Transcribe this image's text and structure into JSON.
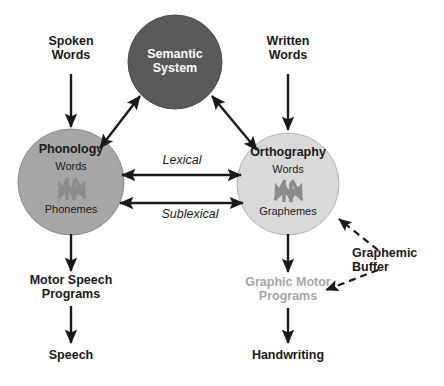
{
  "diagram": {
    "colors": {
      "semantic_fill": "#595959",
      "phonology_fill": "#a6a6a6",
      "orthography_fill": "#d9d9d9",
      "circle_stroke": "#7f7f7f",
      "arrow": "#1a1a1a",
      "inner_arrow": "#808080",
      "muted_text": "#a6a6a6",
      "text": "#1a1a1a",
      "light_text": "#ffffff",
      "background": "#ffffff"
    },
    "circles": [
      {
        "id": "semantic-system",
        "title": "Semantic\nSystem",
        "sub_top": "",
        "sub_bottom": "",
        "cx": 175,
        "cy": 62,
        "r": 47,
        "fill": "#595959",
        "text_color": "#ffffff"
      },
      {
        "id": "phonology",
        "title": "Phonology",
        "sub_top": "Words",
        "sub_bottom": "Phonemes",
        "cx": 71,
        "cy": 182,
        "r": 53,
        "fill": "#a6a6a6",
        "text_color": "#1a1a1a"
      },
      {
        "id": "orthography",
        "title": "Orthography",
        "sub_top": "Words",
        "sub_bottom": "Graphemes",
        "cx": 288,
        "cy": 184,
        "r": 51,
        "fill": "#d9d9d9",
        "text_color": "#1a1a1a"
      }
    ],
    "inputs": [
      {
        "id": "spoken-words",
        "text": "Spoken\nWords",
        "x": 71,
        "y": 38,
        "muted": false
      },
      {
        "id": "written-words",
        "text": "Written\nWords",
        "x": 288,
        "y": 38,
        "muted": false
      }
    ],
    "outputs": [
      {
        "id": "motor-speech-programs",
        "text": "Motor Speech\nProgrammes",
        "x": 71,
        "y": 282,
        "muted": false
      },
      {
        "id": "graphic-motor-programs",
        "text": "Graphic Motor\nProgrammes",
        "x": 288,
        "y": 284,
        "muted": true
      },
      {
        "id": "speech",
        "text": "Speech",
        "x": 71,
        "y": 355,
        "muted": false
      },
      {
        "id": "handwriting",
        "text": "Handwriting",
        "x": 288,
        "y": 355,
        "muted": false
      }
    ],
    "route_labels": [
      {
        "id": "lexical",
        "text": "Lexical",
        "x": 182,
        "y": 162
      },
      {
        "id": "sublexical",
        "text": "Sublexical",
        "x": 188,
        "y": 215
      }
    ],
    "annotations": [
      {
        "id": "graphemic-buffer",
        "text": "Graphemic\nBuffer",
        "x": 400,
        "y": 258
      }
    ],
    "output_label_texts": {
      "motor_speech": "Motor Speech\nPrograms",
      "graphic_motor": "Graphic Motor\nPrograms",
      "speech": "Speech",
      "handwriting": "Handwriting"
    },
    "connections": [
      {
        "id": "spoken-to-phonology",
        "from": "Spoken Words",
        "to": "Phonology",
        "style": "solid",
        "arrows": "single"
      },
      {
        "id": "written-to-orthography",
        "from": "Written Words",
        "to": "Orthography",
        "style": "solid",
        "arrows": "single"
      },
      {
        "id": "phonology-semantic",
        "from": "Phonology",
        "to": "Semantic System",
        "style": "solid",
        "arrows": "double"
      },
      {
        "id": "orthography-semantic",
        "from": "Orthography",
        "to": "Semantic System",
        "style": "solid",
        "arrows": "double"
      },
      {
        "id": "lexical-route",
        "from": "Phonology",
        "to": "Orthography",
        "style": "solid",
        "arrows": "double"
      },
      {
        "id": "sublexical-route",
        "from": "Phonology",
        "to": "Orthography",
        "style": "solid",
        "arrows": "double"
      },
      {
        "id": "phonology-to-motor-speech",
        "from": "Phonology",
        "to": "Motor Speech Programs",
        "style": "solid",
        "arrows": "single"
      },
      {
        "id": "motor-speech-to-speech",
        "from": "Motor Speech Programs",
        "to": "Speech",
        "style": "solid",
        "arrows": "single"
      },
      {
        "id": "orthography-to-graphic-motor",
        "from": "Orthography",
        "to": "Graphic Motor Programs",
        "style": "solid",
        "arrows": "single"
      },
      {
        "id": "graphic-motor-to-handwriting",
        "from": "Graphic Motor Programs",
        "to": "Handwriting",
        "style": "solid",
        "arrows": "single"
      },
      {
        "id": "buffer-to-orthography",
        "from": "Graphemic Buffer",
        "to": "Orthography",
        "style": "dashed",
        "arrows": "single"
      },
      {
        "id": "buffer-to-graphic-motor",
        "from": "Graphemic Buffer",
        "to": "Graphic Motor Programs",
        "style": "dashed",
        "arrows": "single"
      }
    ]
  }
}
